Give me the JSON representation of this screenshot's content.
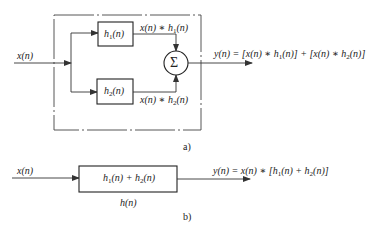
{
  "diagram_a": {
    "caption": "a)",
    "input_label": "x(n)",
    "blocks": [
      {
        "id": "h1",
        "label": "h",
        "sub": "1",
        "arg": "(n)"
      },
      {
        "id": "h2",
        "label": "h",
        "sub": "2",
        "arg": "(n)"
      }
    ],
    "branch_labels": [
      {
        "pre": "x(n) ∗ h",
        "sub": "1",
        "post": "(n)"
      },
      {
        "pre": "x(n) ∗ h",
        "sub": "2",
        "post": "(n)"
      }
    ],
    "summer_symbol": "Σ",
    "output_label": {
      "p1": "y(n) = [x(n) ∗ h",
      "s1": "1",
      "p2": "(n)] + [x(n) ∗ h",
      "s2": "2",
      "p3": "(n)]"
    }
  },
  "diagram_b": {
    "caption": "b)",
    "input_label": "x(n)",
    "block": {
      "p1": "h",
      "s1": "1",
      "p2": "(n) + h",
      "s2": "2",
      "p3": "(n)"
    },
    "block_name": "h(n)",
    "output_label": {
      "p1": "y(n) = x(n) ∗ [h",
      "s1": "1",
      "p2": "(n) + h",
      "s2": "2",
      "p3": "(n)]"
    }
  }
}
